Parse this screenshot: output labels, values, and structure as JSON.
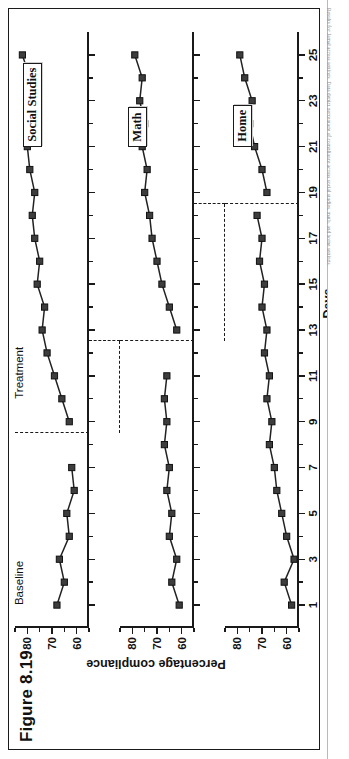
{
  "figure": {
    "title": "Figure 8.19",
    "caption": "Results for Jamal across settings. Data depict percentage of compliance across social studies, math, and home settings."
  },
  "axes": {
    "x_title": "Days",
    "y_title": "Percentage compliance",
    "x_ticks_major": [
      1,
      3,
      5,
      7,
      9,
      11,
      13,
      15,
      17,
      19,
      21,
      23,
      25
    ],
    "x_min": 0,
    "x_max": 26,
    "y_ticks_major": [
      60,
      70,
      80
    ],
    "y_min": 55,
    "y_max": 85
  },
  "conditions": {
    "baseline_label": "Baseline",
    "treatment_label": "Treatment"
  },
  "chart_data": {
    "type": "line",
    "title": "Figure 8.19",
    "xlabel": "Days",
    "ylabel": "Percentage compliance",
    "xlim": [
      0,
      26
    ],
    "ylim": [
      55,
      85
    ],
    "grid": false,
    "legend": "none",
    "design": "multiple baseline across settings",
    "phase_labels": [
      "Baseline",
      "Treatment"
    ],
    "panels": [
      {
        "name": "Social Studies",
        "tag": "Social Studies",
        "phase_change_after_day": 8,
        "series": [
          {
            "name": "Baseline",
            "x": [
              1,
              2,
              3,
              4,
              5,
              6,
              7
            ],
            "values": [
              68,
              65,
              67,
              63,
              64,
              61,
              62
            ]
          },
          {
            "name": "Treatment",
            "x": [
              9,
              10,
              11,
              12,
              13,
              14,
              15,
              16,
              17,
              18,
              19,
              20,
              21,
              22,
              23,
              24,
              25
            ],
            "values": [
              63,
              66,
              69,
              72,
              74,
              73,
              76,
              75,
              77,
              78,
              77,
              79,
              80,
              78,
              80,
              79,
              82
            ]
          }
        ]
      },
      {
        "name": "Math",
        "tag": "Math",
        "phase_change_after_day": 12,
        "series": [
          {
            "name": "Baseline",
            "x": [
              1,
              2,
              3,
              4,
              5,
              6,
              7,
              8,
              9,
              10,
              11
            ],
            "values": [
              61,
              64,
              62,
              65,
              64,
              66,
              65,
              67,
              66,
              67,
              66
            ]
          },
          {
            "name": "Treatment",
            "x": [
              13,
              14,
              15,
              16,
              17,
              18,
              19,
              20,
              21,
              22,
              23,
              24,
              25
            ],
            "values": [
              62,
              65,
              68,
              70,
              72,
              73,
              75,
              74,
              76,
              75,
              77,
              76,
              79
            ]
          }
        ]
      },
      {
        "name": "Home",
        "tag": "Home",
        "phase_change_after_day": 18,
        "series": [
          {
            "name": "Baseline",
            "x": [
              1,
              2,
              3,
              4,
              5,
              6,
              7,
              8,
              9,
              10,
              11,
              12,
              13,
              14,
              15,
              16,
              17,
              18
            ],
            "values": [
              58,
              61,
              57,
              60,
              62,
              64,
              65,
              67,
              66,
              68,
              67,
              69,
              68,
              70,
              69,
              71,
              70,
              72
            ]
          },
          {
            "name": "Treatment",
            "x": [
              19,
              20,
              21,
              22,
              23,
              24,
              25
            ],
            "values": [
              68,
              70,
              73,
              75,
              74,
              77,
              79
            ]
          }
        ]
      }
    ]
  }
}
